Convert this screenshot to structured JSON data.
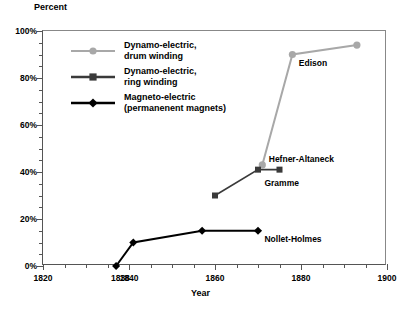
{
  "chart_data": {
    "type": "line",
    "title": "",
    "xlabel": "Year",
    "ylabel": "Percent",
    "xlim": [
      1820,
      1900
    ],
    "ylim": [
      0,
      100
    ],
    "grid": false,
    "legend_position": "inside-top-left",
    "xticks_major": [
      1820,
      1840,
      1860,
      1880,
      1900
    ],
    "xticks_major_labels": [
      "1820",
      "1840",
      "1860",
      "1880",
      "1900"
    ],
    "xtick_extra": {
      "value": 1838,
      "label": "1838"
    },
    "xticks_minor_step": 5,
    "yticks_major": [
      0,
      20,
      40,
      60,
      80,
      100
    ],
    "yticks_major_labels": [
      "0%",
      "20%",
      "40%",
      "60%",
      "80%",
      "100%"
    ],
    "yticks_minor_step": 5,
    "series": [
      {
        "name": "Dynamo-electric, drum winding",
        "color": "#a8a8a8",
        "marker": "circle",
        "x": [
          1871,
          1878,
          1893
        ],
        "values": [
          43,
          90,
          94
        ]
      },
      {
        "name": "Dynamo-electric, ring winding",
        "color": "#3a3a3a",
        "marker": "square",
        "x": [
          1860,
          1870,
          1875
        ],
        "values": [
          30,
          41,
          41
        ]
      },
      {
        "name": "Magneto-electric (permanenent magnets)",
        "color": "#000000",
        "marker": "diamond",
        "x": [
          1837,
          1841,
          1857,
          1870
        ],
        "values": [
          0,
          10,
          15,
          15
        ]
      }
    ],
    "annotations": [
      {
        "text": "Edison",
        "x": 1879.5,
        "y": 86
      },
      {
        "text": "Hefner-Altaneck",
        "x": 1872.5,
        "y": 45
      },
      {
        "text": "Gramme",
        "x": 1871.5,
        "y": 35
      },
      {
        "text": "Nollet-Holmes",
        "x": 1871.5,
        "y": 11
      }
    ]
  },
  "legend": {
    "entries": [
      {
        "line1": "Dynamo-electric,",
        "line2": "drum winding"
      },
      {
        "line1": "Dynamo-electric,",
        "line2": "ring winding"
      },
      {
        "line1": "Magneto-electric",
        "line2": "(permanenent magnets)"
      }
    ]
  },
  "caption": {
    "text": ""
  }
}
